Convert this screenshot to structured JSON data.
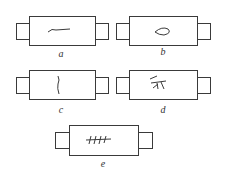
{
  "diagram": {
    "specimens": [
      {
        "id": "a",
        "label": "a",
        "crack": "longitudinal"
      },
      {
        "id": "b",
        "label": "b",
        "crack": "loop"
      },
      {
        "id": "c",
        "label": "c",
        "crack": "transverse"
      },
      {
        "id": "d",
        "label": "d",
        "crack": "branched"
      },
      {
        "id": "e",
        "label": "e",
        "crack": "multiple-transverse"
      }
    ],
    "colors": {
      "stroke": "#3a3a3a",
      "background": "#ffffff"
    }
  }
}
